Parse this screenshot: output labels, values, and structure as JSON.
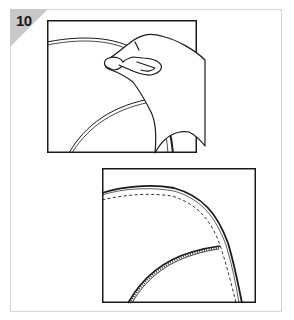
{
  "step": {
    "number": "10",
    "badge_color": "#c8c8c8"
  },
  "panels": [
    {
      "id": "top",
      "description": "Hand pressing and smoothing the edge of a curved piece along a line"
    },
    {
      "id": "bottom",
      "description": "Curved edge with dashed stitch guide and a stitched seam meeting it"
    }
  ],
  "colors": {
    "line": "#1a1a1a",
    "card_border": "#d4d4d4"
  }
}
